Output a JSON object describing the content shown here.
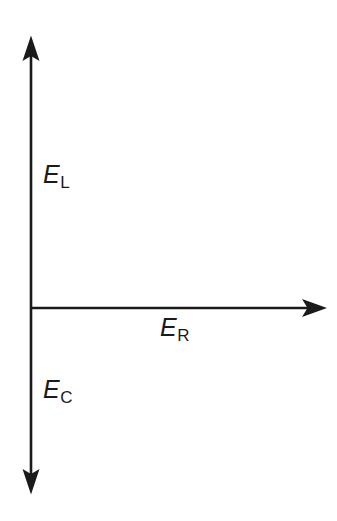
{
  "figure": {
    "type": "phasor-diagram",
    "title": "",
    "background_color": "#ffffff",
    "stroke_color": "#1a1a1a"
  },
  "axes": {
    "vertical": {
      "name": "vertical-double-arrow",
      "arrowheads": "both",
      "x": 31,
      "y_top": 37,
      "y_bottom": 493,
      "stroke_width": 2.6
    },
    "horizontal": {
      "name": "horizontal-arrow",
      "arrowheads": "end",
      "y": 308,
      "x_start": 31,
      "x_end": 326,
      "stroke_width": 2.6
    }
  },
  "origin": {
    "x": 31,
    "y": 308
  },
  "labels": {
    "upward": {
      "symbol": "E",
      "subscript": "L",
      "full_text": "EL",
      "x": 43,
      "y": 162
    },
    "rightward": {
      "symbol": "E",
      "subscript": "R",
      "full_text": "ER",
      "x": 160,
      "y": 315
    },
    "downward": {
      "symbol": "E",
      "subscript": "C",
      "full_text": "EC",
      "x": 43,
      "y": 377
    }
  },
  "chart_data": {
    "type": "scatter",
    "title": "",
    "xlabel": "",
    "ylabel": "",
    "grid": false,
    "legend": false,
    "annotations": [
      "EL",
      "ER",
      "EC"
    ],
    "series": [
      {
        "name": "EL",
        "direction": "up",
        "origin": [
          31,
          308
        ],
        "tip": [
          31,
          37
        ],
        "label": "EL"
      },
      {
        "name": "ER",
        "direction": "right",
        "origin": [
          31,
          308
        ],
        "tip": [
          326,
          308
        ],
        "label": "ER"
      },
      {
        "name": "EC",
        "direction": "down",
        "origin": [
          31,
          308
        ],
        "tip": [
          31,
          493
        ],
        "label": "EC"
      }
    ]
  }
}
